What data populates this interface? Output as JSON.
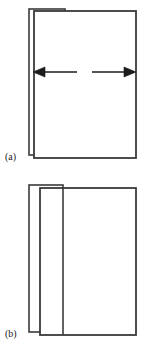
{
  "figure": {
    "type": "line-diagram",
    "background_color": "#ffffff",
    "stroke_color": "#3a3a3a",
    "stroke_color_dark": "#1b1b1b",
    "canvas": {
      "width": 149,
      "height": 348
    },
    "panels": [
      {
        "id": "a",
        "label": "(a)",
        "label_position": {
          "x": 5,
          "y": 160
        },
        "description": "Two overlapping rectangles with a horizontal double-headed expansion arrow",
        "back_rect": {
          "x": 29,
          "y": 9,
          "width": 36,
          "height": 146
        },
        "front_rect": {
          "x": 34,
          "y": 11,
          "width": 102,
          "height": 147
        },
        "arrow": {
          "name": "bidirectional-expansion-arrow",
          "y": 72,
          "left_head_tip_x": 33,
          "left_shaft_end_x": 77,
          "right_shaft_start_x": 92,
          "right_head_tip_x": 136,
          "head_width": 11,
          "head_height": 9
        },
        "internal_divider": null
      },
      {
        "id": "b",
        "label": "(b)",
        "label_position": {
          "x": 5,
          "y": 337
        },
        "description": "Two overlapping rectangles with an additional internal vertical divider line",
        "back_rect": {
          "x": 29,
          "y": 185,
          "width": 34,
          "height": 147
        },
        "front_rect": {
          "x": 40,
          "y": 188,
          "width": 96,
          "height": 147
        },
        "arrow": null,
        "internal_divider": {
          "x": 63,
          "y_top": 188,
          "y_bottom": 335
        }
      }
    ]
  }
}
